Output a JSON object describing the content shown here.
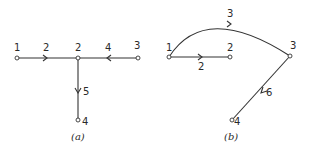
{
  "figure": {
    "panels": [
      {
        "id": "a",
        "caption": "(a)",
        "nodes": [
          {
            "id": "1",
            "label": "1",
            "x": 17,
            "y": 58
          },
          {
            "id": "2",
            "label": "2",
            "x": 78,
            "y": 58
          },
          {
            "id": "3",
            "label": "3",
            "x": 138,
            "y": 58
          },
          {
            "id": "4",
            "label": "4",
            "x": 78,
            "y": 120
          }
        ],
        "edges": [
          {
            "from": "1",
            "to": "2",
            "label": "2",
            "direction": "1→2"
          },
          {
            "from": "3",
            "to": "2",
            "label": "4",
            "direction": "3→2"
          },
          {
            "from": "2",
            "to": "4",
            "label": "5",
            "direction": "2→4"
          }
        ]
      },
      {
        "id": "b",
        "caption": "(b)",
        "nodes": [
          {
            "id": "1",
            "label": "1",
            "x": 169,
            "y": 57
          },
          {
            "id": "2",
            "label": "2",
            "x": 230,
            "y": 57
          },
          {
            "id": "3",
            "label": "3",
            "x": 290,
            "y": 56
          },
          {
            "id": "4",
            "label": "4",
            "x": 232,
            "y": 120
          }
        ],
        "edges": [
          {
            "from": "1",
            "to": "2",
            "label": "2",
            "direction": "1→2"
          },
          {
            "from": "1",
            "to": "3",
            "label": "3",
            "direction": "1→3",
            "shape": "arc"
          },
          {
            "from": "3",
            "to": "4",
            "label": "6",
            "direction": "3→4"
          }
        ]
      }
    ]
  }
}
